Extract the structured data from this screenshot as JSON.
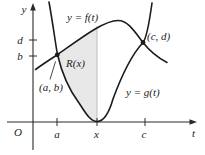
{
  "figure": {
    "axes": {
      "y_label": "y",
      "t_label": "t",
      "origin_label": "O"
    },
    "t_tick_labels": [
      "a",
      "x",
      "c"
    ],
    "y_tick_labels": [
      "d",
      "b"
    ],
    "curve_labels": {
      "f": "y = f(t)",
      "g": "y = g(t)"
    },
    "point_labels": {
      "ab": "(a, b)",
      "cd": "(c, d)"
    },
    "region_label": "R(x)",
    "colors": {
      "shade": "#e8e8e8",
      "guide": "#c6c6c6",
      "ink": "#1c1c1c",
      "background": "#ffffff"
    }
  }
}
